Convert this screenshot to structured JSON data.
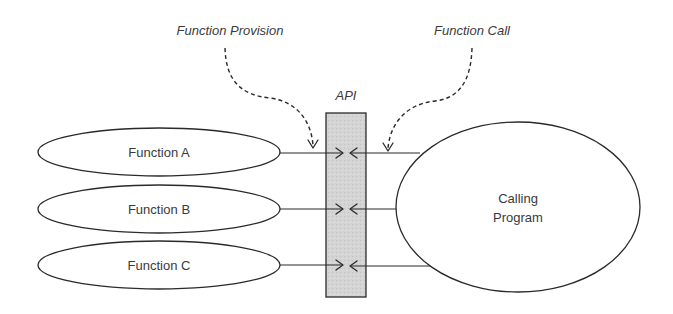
{
  "diagram": {
    "annotations": {
      "function_provision": "Function Provision",
      "function_call": "Function Call"
    },
    "api": {
      "label": "API",
      "fill_color": "#d4d4d4"
    },
    "functions": [
      {
        "label": "Function A"
      },
      {
        "label": "Function B"
      },
      {
        "label": "Function C"
      }
    ],
    "calling_program": {
      "line1": "Calling",
      "line2": "Program"
    },
    "colors": {
      "stroke": "#2a2a2a",
      "text": "#3a3a3a",
      "background": "#ffffff"
    }
  }
}
